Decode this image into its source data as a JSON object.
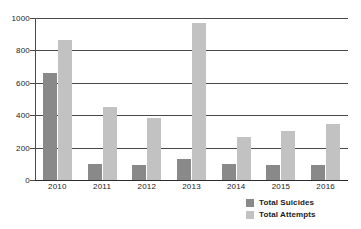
{
  "chart_data": {
    "type": "bar",
    "title": "",
    "subtitle": "",
    "xlabel": "",
    "ylabel": "",
    "categories": [
      "2010",
      "2011",
      "2012",
      "2013",
      "2014",
      "2015",
      "2016"
    ],
    "series": [
      {
        "name": "Total Suicides",
        "color": "#898989",
        "values": [
          660,
          100,
          95,
          130,
          100,
          90,
          95
        ]
      },
      {
        "name": "Total Attempts",
        "color": "#c2c2c2",
        "values": [
          865,
          450,
          380,
          970,
          265,
          305,
          345
        ]
      }
    ],
    "ylim": [
      0,
      1000
    ],
    "y_ticks": [
      0,
      200,
      400,
      600,
      800,
      1000
    ],
    "y_tick_labels": [
      "0",
      "200",
      "400",
      "600",
      "800",
      "1000"
    ],
    "grid": true,
    "grid_axis": "y",
    "legend_position": "bottom-right",
    "annotations": []
  }
}
